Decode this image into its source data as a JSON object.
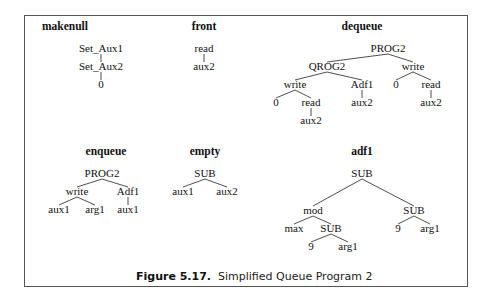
{
  "figure": {
    "caption_label": "Figure 5.17.",
    "caption_text": "Simplified Queue Program 2"
  },
  "trees": [
    {
      "id": "makenull",
      "title": "makenull",
      "title_pos": [
        65,
        30
      ],
      "nodes": [
        {
          "id": "n1",
          "label": "Set_Aux1",
          "x": 101,
          "y": 52
        },
        {
          "id": "n2",
          "label": "Set_Aux2",
          "x": 101,
          "y": 70
        },
        {
          "id": "n3",
          "label": "0",
          "x": 101,
          "y": 88
        }
      ],
      "edges": [
        [
          "n1",
          "n2"
        ],
        [
          "n2",
          "n3"
        ]
      ]
    },
    {
      "id": "front",
      "title": "front",
      "title_pos": [
        204,
        30
      ],
      "nodes": [
        {
          "id": "n1",
          "label": "read",
          "x": 204,
          "y": 52
        },
        {
          "id": "n2",
          "label": "aux2",
          "x": 204,
          "y": 70
        }
      ],
      "edges": [
        [
          "n1",
          "n2"
        ]
      ]
    },
    {
      "id": "dequeue",
      "title": "dequeue",
      "title_pos": [
        362,
        30
      ],
      "nodes": [
        {
          "id": "p",
          "label": "PROG2",
          "x": 388,
          "y": 52
        },
        {
          "id": "q",
          "label": "QROG2",
          "x": 327,
          "y": 70
        },
        {
          "id": "w2",
          "label": "write",
          "x": 413,
          "y": 70
        },
        {
          "id": "w1",
          "label": "write",
          "x": 295,
          "y": 88
        },
        {
          "id": "a",
          "label": "Adf1",
          "x": 362,
          "y": 88
        },
        {
          "id": "z2",
          "label": "0",
          "x": 396,
          "y": 88
        },
        {
          "id": "r2",
          "label": "read",
          "x": 431,
          "y": 88
        },
        {
          "id": "z1",
          "label": "0",
          "x": 276,
          "y": 106
        },
        {
          "id": "r1",
          "label": "read",
          "x": 311,
          "y": 106
        },
        {
          "id": "ax",
          "label": "aux2",
          "x": 362,
          "y": 106
        },
        {
          "id": "ax3",
          "label": "aux2",
          "x": 431,
          "y": 106
        },
        {
          "id": "ax2",
          "label": "aux2",
          "x": 311,
          "y": 124
        }
      ],
      "edges": [
        [
          "p",
          "q"
        ],
        [
          "p",
          "w2"
        ],
        [
          "q",
          "w1"
        ],
        [
          "q",
          "a"
        ],
        [
          "w2",
          "z2"
        ],
        [
          "w2",
          "r2"
        ],
        [
          "w1",
          "z1"
        ],
        [
          "w1",
          "r1"
        ],
        [
          "a",
          "ax"
        ],
        [
          "r2",
          "ax3"
        ],
        [
          "r1",
          "ax2"
        ]
      ]
    },
    {
      "id": "enqueue",
      "title": "enqueue",
      "title_pos": [
        106,
        155
      ],
      "nodes": [
        {
          "id": "p",
          "label": "PROG2",
          "x": 102,
          "y": 177
        },
        {
          "id": "w",
          "label": "write",
          "x": 77,
          "y": 195
        },
        {
          "id": "a",
          "label": "Adf1",
          "x": 128,
          "y": 195
        },
        {
          "id": "x1",
          "label": "aux1",
          "x": 59,
          "y": 213
        },
        {
          "id": "g1",
          "label": "arg1",
          "x": 95,
          "y": 213
        },
        {
          "id": "x2",
          "label": "aux1",
          "x": 128,
          "y": 213
        }
      ],
      "edges": [
        [
          "p",
          "w"
        ],
        [
          "p",
          "a"
        ],
        [
          "w",
          "x1"
        ],
        [
          "w",
          "g1"
        ],
        [
          "a",
          "x2"
        ]
      ]
    },
    {
      "id": "empty",
      "title": "empty",
      "title_pos": [
        205,
        155
      ],
      "nodes": [
        {
          "id": "s",
          "label": "SUB",
          "x": 205,
          "y": 177
        },
        {
          "id": "x1",
          "label": "aux1",
          "x": 183,
          "y": 195
        },
        {
          "id": "x2",
          "label": "aux2",
          "x": 227,
          "y": 195
        }
      ],
      "edges": [
        [
          "s",
          "x1"
        ],
        [
          "s",
          "x2"
        ]
      ]
    },
    {
      "id": "adf1",
      "title": "adf1",
      "title_pos": [
        362,
        155
      ],
      "nodes": [
        {
          "id": "s",
          "label": "SUB",
          "x": 362,
          "y": 177
        },
        {
          "id": "m",
          "label": "mod",
          "x": 313,
          "y": 214
        },
        {
          "id": "s3",
          "label": "SUB",
          "x": 414,
          "y": 214
        },
        {
          "id": "mx",
          "label": "max",
          "x": 294,
          "y": 232
        },
        {
          "id": "s2",
          "label": "SUB",
          "x": 331,
          "y": 232
        },
        {
          "id": "n9b",
          "label": "9",
          "x": 398,
          "y": 232
        },
        {
          "id": "g1b",
          "label": "arg1",
          "x": 430,
          "y": 232
        },
        {
          "id": "n9",
          "label": "9",
          "x": 311,
          "y": 250
        },
        {
          "id": "g1",
          "label": "arg1",
          "x": 348,
          "y": 250
        }
      ],
      "edges": [
        [
          "s",
          "m"
        ],
        [
          "s",
          "s3"
        ],
        [
          "m",
          "mx"
        ],
        [
          "m",
          "s2"
        ],
        [
          "s3",
          "n9b"
        ],
        [
          "s3",
          "g1b"
        ],
        [
          "s2",
          "n9"
        ],
        [
          "s2",
          "g1"
        ]
      ]
    }
  ]
}
